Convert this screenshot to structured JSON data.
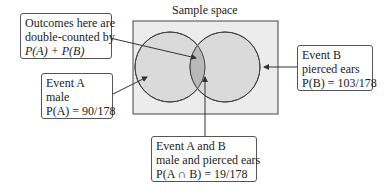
{
  "title": "Sample space",
  "boxes": {
    "double": {
      "line1": "Outcomes here are",
      "line2": "double-counted by",
      "line3": "P(A) + P(B)"
    },
    "eventA": {
      "line1": "Event A",
      "line2": "male",
      "line3": "P(A) = 90/178"
    },
    "eventB": {
      "line1": "Event B",
      "line2": "pierced ears",
      "line3": "P(B) = 103/178"
    },
    "both": {
      "line1": "Event A and B",
      "line2": "male and pierced ears",
      "line3": "P(A ∩ B) = 19/178"
    }
  },
  "colors": {
    "sample_space": "#ececec",
    "circle": "#dadada",
    "intersection": "#b9b9b9",
    "stroke": "#444444"
  }
}
